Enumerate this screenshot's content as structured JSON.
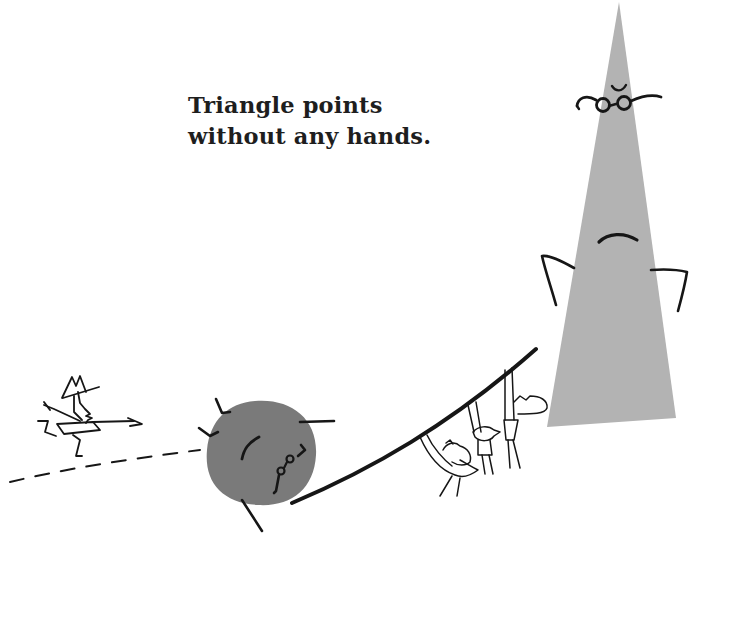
{
  "caption": {
    "line1": "Triangle points",
    "line2": "without any hands."
  },
  "characters": [
    {
      "name": "triangle",
      "description": "tall grey triangle with glasses and frown, arms on hips"
    },
    {
      "name": "circle",
      "description": "dark grey circle with glasses, tilted, rolling"
    },
    {
      "name": "running-man",
      "description": "small stick figure in hat running left to right"
    },
    {
      "name": "hanging-figures",
      "description": "three small figures hanging beneath a curved line"
    }
  ],
  "colors": {
    "background": "#ffffff",
    "ink": "#161616",
    "triangle_fill": "#b3b3b3",
    "circle_fill": "#7a7a7a"
  }
}
